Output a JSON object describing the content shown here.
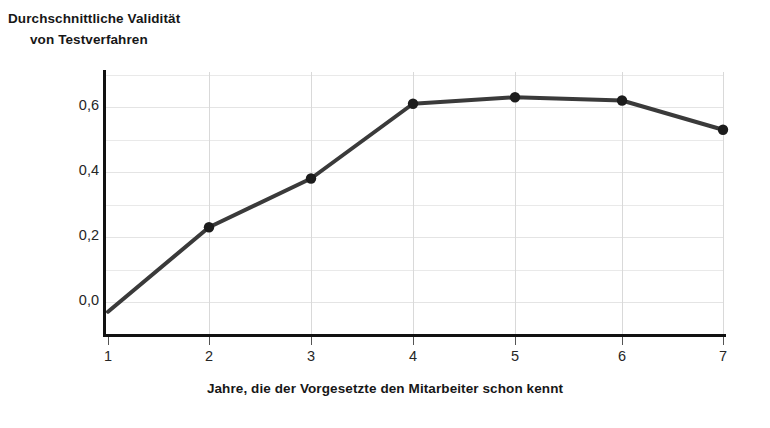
{
  "chart_data": {
    "type": "line",
    "title": "Durchschnittliche Validität von Testverfahren",
    "title_line1": "Durchschnittliche Validität",
    "title_line2": "von Testverfahren",
    "xlabel": "Jahre, die der Vorgesetzte den Mitarbeiter schon kennt",
    "ylabel": "",
    "x": [
      1,
      2,
      3,
      4,
      5,
      6,
      7
    ],
    "values": [
      -0.03,
      0.23,
      0.38,
      0.61,
      0.63,
      0.62,
      0.53
    ],
    "categories": [
      "1",
      "2",
      "3",
      "4",
      "5",
      "6",
      "7"
    ],
    "xtick_labels": [
      "1",
      "2",
      "3",
      "4",
      "5",
      "6",
      "7"
    ],
    "ytick_labels": [
      "0,0",
      "0,2",
      "0,4",
      "0,6"
    ],
    "ytick_values": [
      0.0,
      0.2,
      0.4,
      0.6
    ],
    "minor_gridline_values": [
      0.1,
      0.3,
      0.5,
      0.7
    ],
    "all_gridline_values": [
      0.0,
      0.1,
      0.2,
      0.3,
      0.4,
      0.5,
      0.6,
      0.7
    ],
    "xlim": [
      1,
      7
    ],
    "ylim": [
      -0.07,
      0.71
    ],
    "grid": true,
    "legend": false,
    "legend_position": "none",
    "series": [
      {
        "name": "Durchschnittliche Validität",
        "values": [
          -0.03,
          0.23,
          0.38,
          0.61,
          0.63,
          0.62,
          0.53
        ],
        "marker": "circle",
        "markers_shown_at_x": [
          2,
          3,
          4,
          5,
          6,
          7
        ],
        "color": "#3a3a3a",
        "line_width": 4
      }
    ],
    "colors": {
      "line": "#3a3a3a",
      "marker": "#1c1c1c",
      "axis": "#111111",
      "gridline_major": "#e4e4e4",
      "gridline_minor": "#e9e9e9",
      "gridline_vertical": "#d9d9d9",
      "text": "#171717",
      "tick_text": "#262626",
      "background": "#ffffff"
    }
  }
}
